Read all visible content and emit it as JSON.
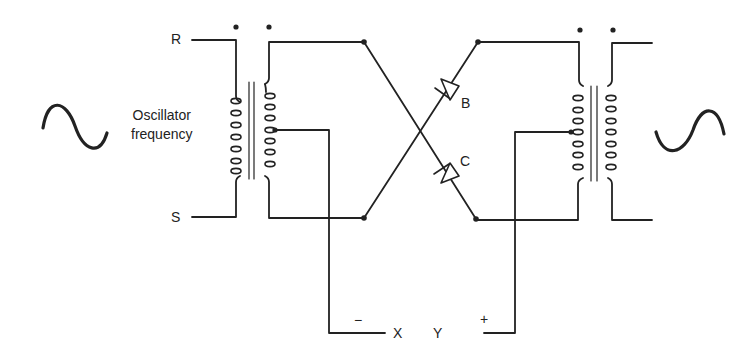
{
  "diagram": {
    "type": "circuit",
    "labels": {
      "terminal_r": "R",
      "terminal_s": "S",
      "oscillator": "Oscillator",
      "oscillator_line2": "frequency",
      "diode_b": "B",
      "diode_c": "C",
      "output_x": "X",
      "output_y": "Y",
      "minus": "−",
      "plus": "+"
    },
    "components": [
      {
        "id": "left-ac-source",
        "symbol": "sine-wave"
      },
      {
        "id": "input-transformer",
        "type": "center-tapped transformer",
        "dots": 2
      },
      {
        "id": "diode-b",
        "label": "B"
      },
      {
        "id": "diode-c",
        "label": "C"
      },
      {
        "id": "output-transformer",
        "type": "center-tapped transformer",
        "dots": 2
      },
      {
        "id": "right-ac-source",
        "symbol": "sine-wave"
      }
    ],
    "colors": {
      "ink": "#222222",
      "background": "#ffffff"
    }
  }
}
